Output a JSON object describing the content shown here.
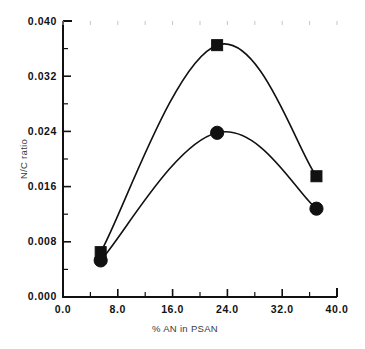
{
  "chart_data": {
    "type": "line",
    "title": "",
    "subtitle": "",
    "xlabel": "% AN in PSAN",
    "ylabel": "N/C ratio",
    "xlim": [
      0.0,
      40.0
    ],
    "ylim": [
      0.0,
      0.04
    ],
    "grid": false,
    "legend_position": "none",
    "x_ticks": [
      0.0,
      8.0,
      16.0,
      24.0,
      32.0,
      40.0
    ],
    "x_tick_labels": [
      "0.0",
      "8.0",
      "16.0",
      "24.0",
      "32.0",
      "40.0"
    ],
    "x_minor_ticks": [
      4.0,
      12.0,
      20.0,
      28.0,
      36.0
    ],
    "y_ticks": [
      0.0,
      0.008,
      0.016,
      0.024,
      0.032,
      0.04
    ],
    "y_tick_labels": [
      "0.000",
      "0.008",
      "0.016",
      "0.024",
      "0.032",
      "0.040"
    ],
    "y_minor_ticks": [
      0.004,
      0.012,
      0.02,
      0.028,
      0.036
    ],
    "series": [
      {
        "name": "square-series",
        "marker": "square",
        "color": "#111111",
        "x": [
          5.5,
          22.5,
          37.0
        ],
        "values": [
          0.0065,
          0.0365,
          0.0175
        ]
      },
      {
        "name": "circle-series",
        "marker": "circle",
        "color": "#111111",
        "x": [
          5.5,
          22.5,
          37.0
        ],
        "values": [
          0.0053,
          0.0238,
          0.0128
        ]
      }
    ]
  },
  "axes": {
    "x_title": "% AN in PSAN",
    "y_title": "N/C ratio",
    "x_labels": [
      "0.0",
      "8.0",
      "16.0",
      "24.0",
      "32.0",
      "40.0"
    ],
    "y_labels": [
      "0.000",
      "0.008",
      "0.016",
      "0.024",
      "0.032",
      "0.040"
    ]
  },
  "colors": {
    "ink": "#111111",
    "label": "#3a3a3a",
    "background": "#ffffff"
  }
}
